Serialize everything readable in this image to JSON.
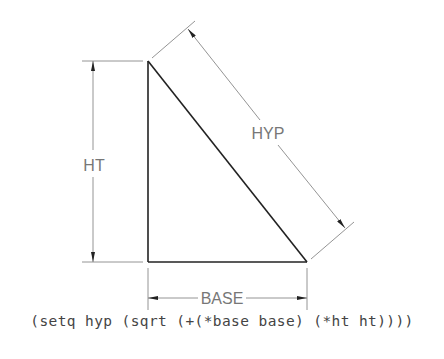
{
  "diagram": {
    "type": "right-triangle-dimension-drawing",
    "labels": {
      "height": "HT",
      "hypotenuse": "HYP",
      "base": "BASE"
    },
    "code": "(setq hyp (sqrt (+(*base base) (*ht ht))))",
    "colors": {
      "triangle": "#222222",
      "dimension": "#777777",
      "text": "#777777"
    }
  }
}
